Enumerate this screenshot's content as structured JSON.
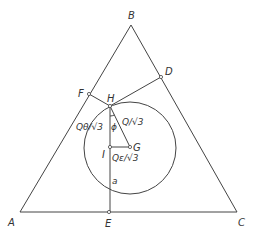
{
  "diagram": {
    "type": "equilateral-triangle-geometry",
    "vertices": {
      "A": {
        "label": "A",
        "x": 20,
        "y": 212
      },
      "B": {
        "label": "B",
        "x": 131,
        "y": 25
      },
      "C": {
        "label": "C",
        "x": 237,
        "y": 212
      }
    },
    "points": {
      "D": {
        "label": "D",
        "x": 161,
        "y": 77
      },
      "E": {
        "label": "E",
        "x": 109,
        "y": 212
      },
      "F": {
        "label": "F",
        "x": 89,
        "y": 94
      },
      "H": {
        "label": "H",
        "x": 110,
        "y": 106
      },
      "I": {
        "label": "I",
        "x": 110,
        "y": 147
      },
      "G": {
        "label": "G",
        "x": 130,
        "y": 147
      }
    },
    "circle": {
      "cx": 130,
      "cy": 148,
      "r": 46
    },
    "labels": {
      "q_theta": "Qθ/√3",
      "q": "Q/√3",
      "q_epsilon": "Qε/√3",
      "phi": "ϕ",
      "a": "a"
    }
  }
}
